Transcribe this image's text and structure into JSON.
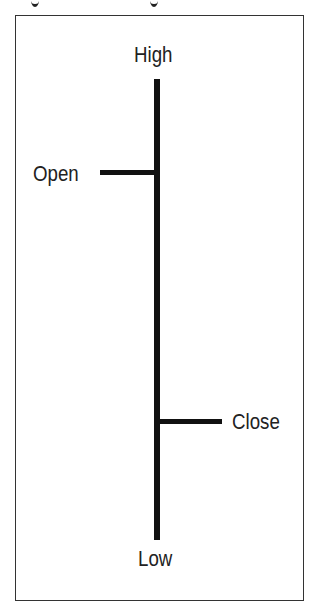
{
  "diagram": {
    "type": "OHLC bar anatomy",
    "labels": {
      "high": "High",
      "open": "Open",
      "close": "Close",
      "low": "Low"
    },
    "colors": {
      "line": "#111111",
      "frame": "#333333",
      "text": "#222222",
      "background": "#ffffff"
    }
  }
}
